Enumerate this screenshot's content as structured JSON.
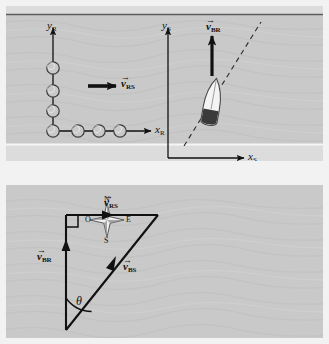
{
  "figure": {
    "background_color": "#f2f2f2",
    "panel_color": "#c9c9c9",
    "ink_color": "#111111"
  },
  "panel_top": {
    "name": "river-scene-panel",
    "river": {
      "top_bank_label": "top-bank-line",
      "bottom_bank_label": "bottom-bank-line"
    },
    "frame_river": {
      "y_axis_label": "y",
      "y_axis_sub": "R",
      "x_axis_label": "x",
      "x_axis_sub": "R",
      "vector_label": "v",
      "vector_sub": "RS",
      "vector_hat": "→"
    },
    "frame_shore": {
      "y_axis_label": "y",
      "y_axis_sub": "S",
      "x_axis_label": "x",
      "x_axis_sub": "S",
      "vector_label": "v",
      "vector_sub": "BR",
      "vector_hat": "→"
    },
    "boat": {
      "name": "boat-icon",
      "hull_color": "#f4f4f4",
      "stern_color": "#3a3a3a"
    },
    "trajectory": {
      "name": "boat-trajectory-dashed-line",
      "style": "dashed"
    }
  },
  "panel_bottom": {
    "name": "vector-triangle-panel",
    "compass": {
      "north": "N",
      "east": "E",
      "south": "S",
      "west": "O"
    },
    "vectors": [
      {
        "label": "v",
        "sub": "RS",
        "hat": "→",
        "name": "vector-v-rs"
      },
      {
        "label": "v",
        "sub": "BR",
        "hat": "→",
        "name": "vector-v-br"
      },
      {
        "label": "v",
        "sub": "BS",
        "hat": "→",
        "name": "vector-v-bs"
      }
    ],
    "angle": {
      "symbol": "θ",
      "name": "angle-theta"
    },
    "right_angle": {
      "name": "right-angle-marker"
    }
  }
}
